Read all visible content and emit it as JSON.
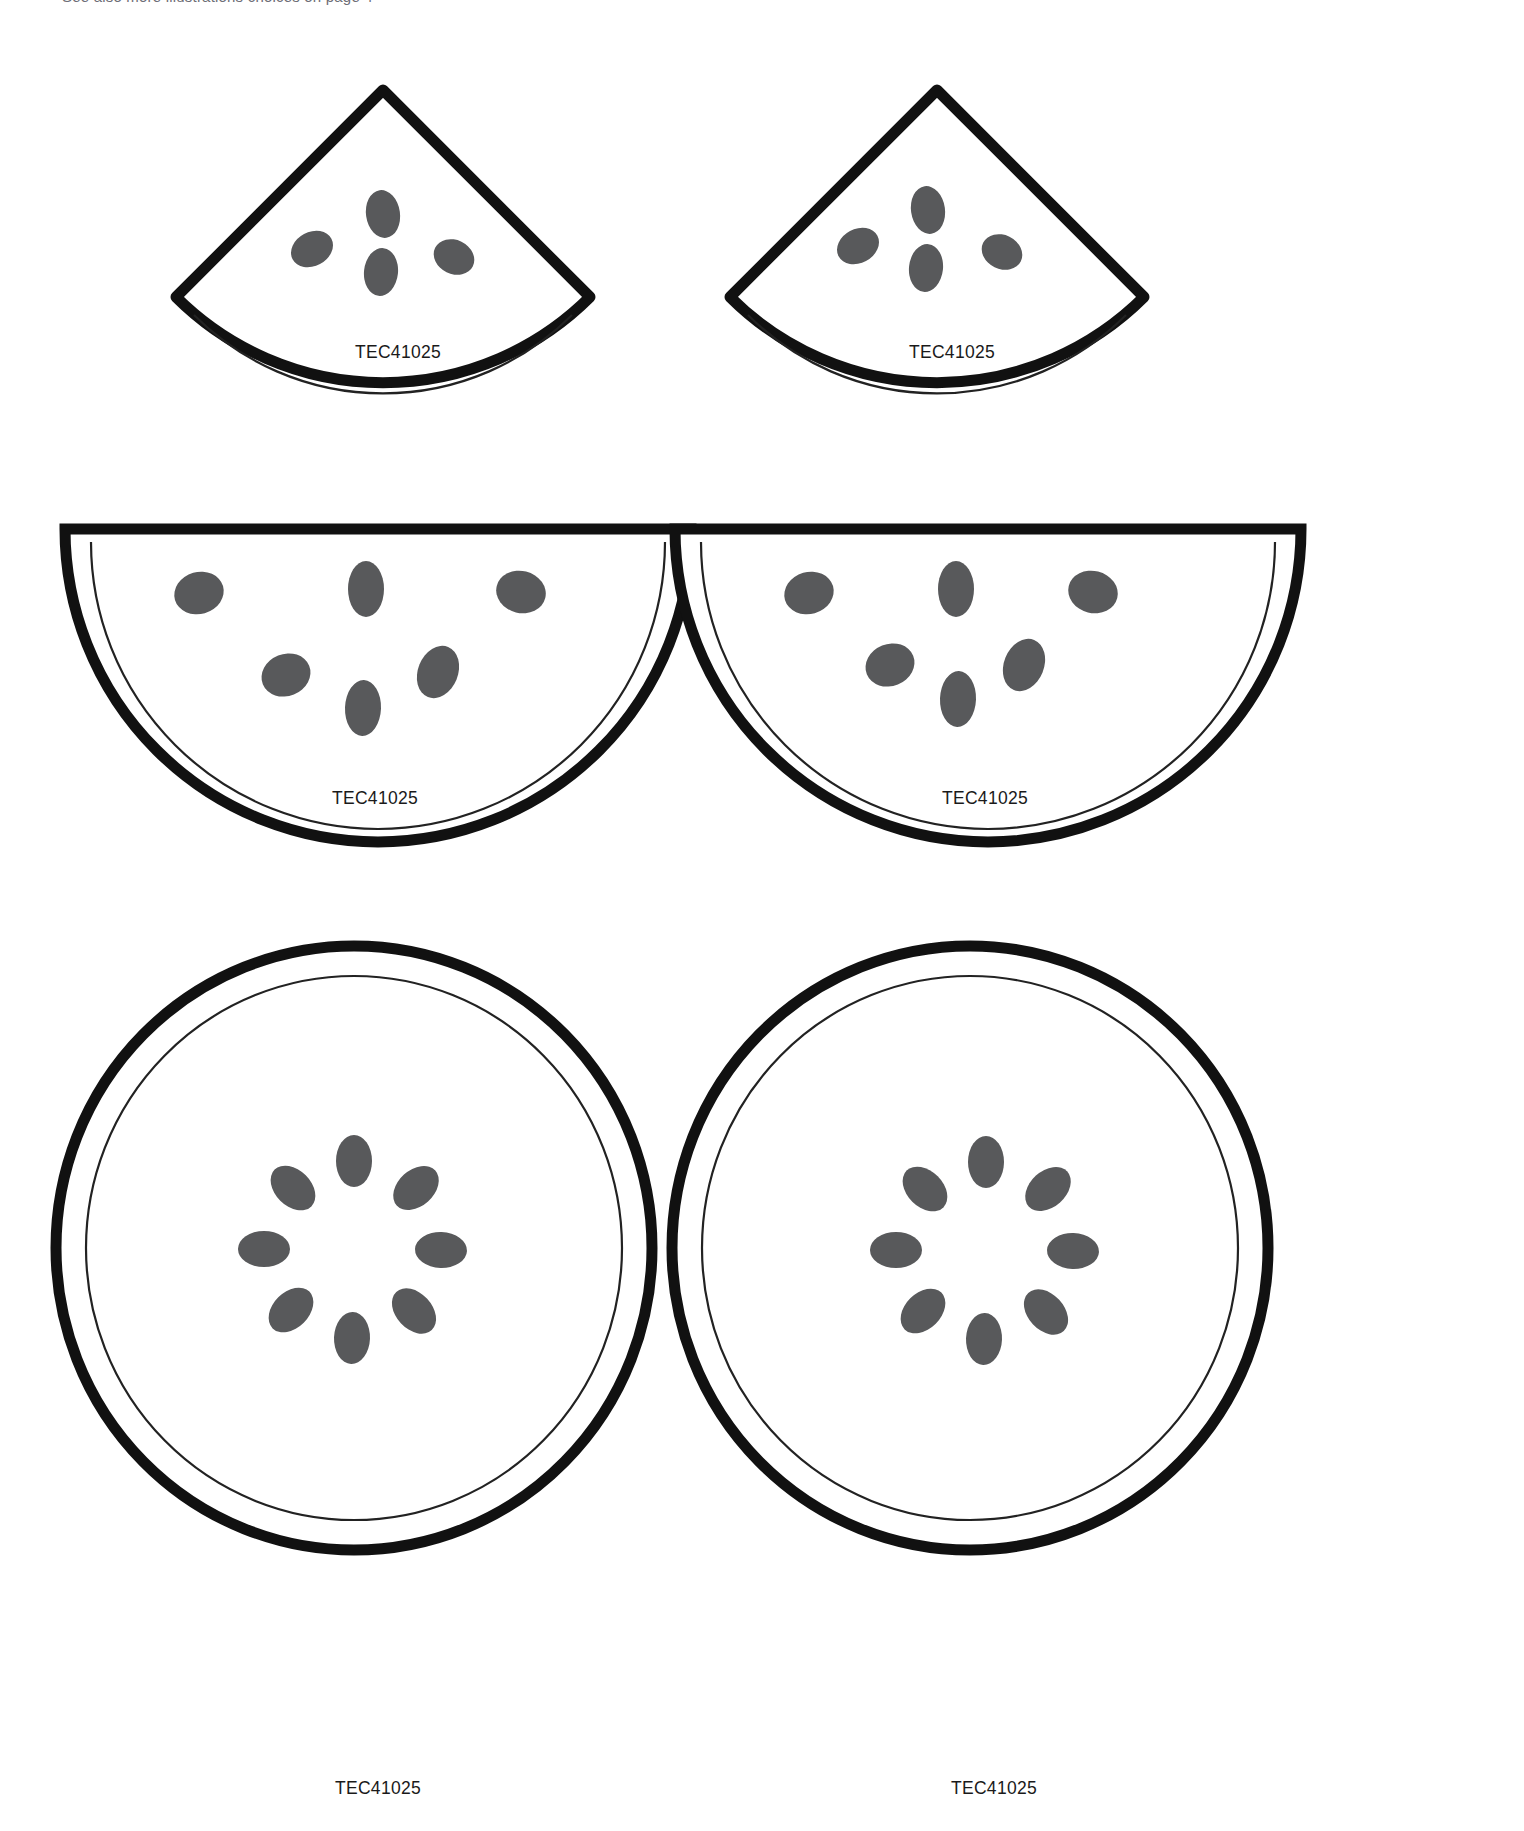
{
  "page": {
    "header_note": "See also  more illustrations choices on page 4",
    "background_color": "#ffffff",
    "width": 1524,
    "height": 1831
  },
  "style": {
    "outline_color": "#111111",
    "rind_line_color": "#222222",
    "seed_color": "#58595b",
    "flesh_fill": "#ffffff",
    "thick_stroke_px": 11,
    "thin_stroke_px": 2
  },
  "sheet": {
    "title": "Watermelon cut-out template sheet",
    "rows": [
      {
        "row_name": "quarter-wedge-row",
        "shape_type": "quarter-wedge",
        "seed_count": 4,
        "items": [
          {
            "id": "wedge-left",
            "label": "TEC41025"
          },
          {
            "id": "wedge-right",
            "label": "TEC41025"
          }
        ]
      },
      {
        "row_name": "half-circle-row",
        "shape_type": "half-circle",
        "seed_count": 6,
        "items": [
          {
            "id": "half-left",
            "label": "TEC41025"
          },
          {
            "id": "half-right",
            "label": "TEC41025"
          }
        ]
      },
      {
        "row_name": "full-circle-row",
        "shape_type": "full-circle",
        "seed_count": 8,
        "items": [
          {
            "id": "circle-left",
            "label": "TEC41025"
          },
          {
            "id": "circle-right",
            "label": "TEC41025"
          }
        ]
      }
    ]
  },
  "seeds": {
    "wedge": [
      {
        "cx": 75,
        "cy": 62,
        "rx": 16,
        "ry": 22,
        "rot": -10
      },
      {
        "cx": 35,
        "cy": 100,
        "rx": 20,
        "ry": 16,
        "rot": -25
      },
      {
        "cx": 75,
        "cy": 113,
        "rx": 16,
        "ry": 22,
        "rot": 5
      },
      {
        "cx": 117,
        "cy": 103,
        "rx": 19,
        "ry": 16,
        "rot": 25
      }
    ],
    "half": [
      {
        "cx": 152,
        "cy": 76,
        "rx": 24,
        "ry": 20,
        "rot": -15
      },
      {
        "cx": 296,
        "cy": 70,
        "rx": 18,
        "ry": 26,
        "rot": 0
      },
      {
        "cx": 440,
        "cy": 74,
        "rx": 23,
        "ry": 20,
        "rot": 12
      },
      {
        "cx": 227,
        "cy": 152,
        "rx": 24,
        "ry": 20,
        "rot": -20
      },
      {
        "cx": 300,
        "cy": 182,
        "rx": 18,
        "ry": 26,
        "rot": 3
      },
      {
        "cx": 374,
        "cy": 150,
        "rx": 19,
        "ry": 26,
        "rot": 20
      }
    ],
    "circle": [
      {
        "cx": 0,
        "cy": -85,
        "rx": 17,
        "ry": 25,
        "rot": 0
      },
      {
        "cx": 60,
        "cy": -60,
        "rx": 17,
        "ry": 25,
        "rot": 45
      },
      {
        "cx": 85,
        "cy": 0,
        "rx": 17,
        "ry": 25,
        "rot": 90
      },
      {
        "cx": 60,
        "cy": 60,
        "rx": 17,
        "ry": 25,
        "rot": 135
      },
      {
        "cx": 0,
        "cy": 85,
        "rx": 17,
        "ry": 25,
        "rot": 180
      },
      {
        "cx": -60,
        "cy": 60,
        "rx": 17,
        "ry": 25,
        "rot": 225
      },
      {
        "cx": -85,
        "cy": 0,
        "rx": 17,
        "ry": 25,
        "rot": 270
      },
      {
        "cx": -60,
        "cy": -60,
        "rx": 17,
        "ry": 25,
        "rot": 315
      }
    ]
  }
}
